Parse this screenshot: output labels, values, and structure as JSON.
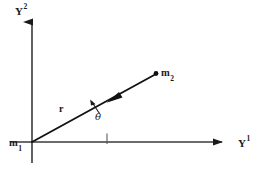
{
  "figure": {
    "caption_present": false,
    "background_color": "#ffffff",
    "ink_color": "#1a1a1a",
    "width": 266,
    "height": 174
  },
  "axes": {
    "horizontal": {
      "name": "horizontal-axis",
      "label_base": "Y",
      "label_superscript": "1",
      "label_text": "Y",
      "superscript_text": "1",
      "start_x": 10,
      "end_x": 228,
      "y": 142,
      "has_arrowhead": true,
      "arrow_direction": "right"
    },
    "vertical": {
      "name": "vertical-axis",
      "label_base": "Y",
      "label_superscript": "2",
      "label_text": "Y",
      "superscript_text": "2",
      "x": 32,
      "start_y": 163,
      "end_y": 16,
      "has_arrowhead": true,
      "arrow_direction": "up"
    }
  },
  "points": {
    "origin": {
      "name": "mass-one",
      "label_text": "m",
      "subscript_text": "1",
      "x": 32,
      "y": 142,
      "marker": "none"
    },
    "mass_two": {
      "name": "mass-two",
      "label_text": "m",
      "subscript_text": "2",
      "x": 156,
      "y": 74,
      "marker": "filled-dot"
    }
  },
  "vector": {
    "name": "position-vector-r",
    "label_text": "r",
    "style": "bold-italic-serif",
    "from_x": 32,
    "from_y": 142,
    "to_x": 156,
    "to_y": 74,
    "arrow_direction": "toward-origin",
    "arrow_at_x": 110,
    "arrow_at_y": 100,
    "label_x": 62,
    "label_y": 108
  },
  "angle": {
    "name": "angle-theta",
    "symbol": "θ",
    "label_x": 96,
    "label_y": 118,
    "vertex_x": 32,
    "vertex_y": 142,
    "between": [
      "horizontal-axis",
      "position-vector-r"
    ],
    "pointer_arrow": true,
    "axis_tick_x": 107
  },
  "labels": {
    "y1": "Y",
    "y1_sup": "1",
    "y2": "Y",
    "y2_sup": "2",
    "m1": "m",
    "m1_sub": "1",
    "m2": "m",
    "m2_sub": "2",
    "r": "r",
    "theta": "θ"
  }
}
